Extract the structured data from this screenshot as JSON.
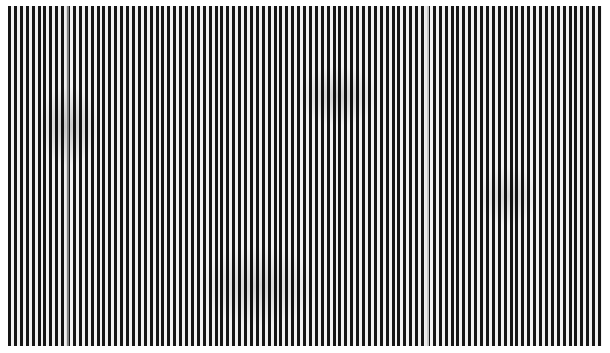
{
  "image": {
    "description": "Photograph of a grating of vertical black and white stripes",
    "stripe_colors": {
      "dark": "#151515",
      "light": "#f2f2f2"
    },
    "background": "#ffffff"
  }
}
